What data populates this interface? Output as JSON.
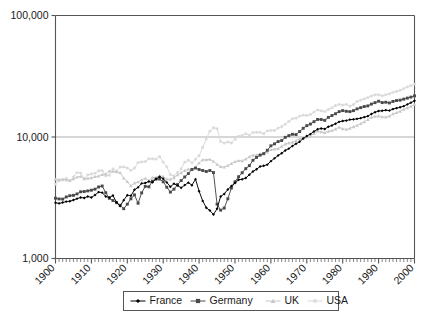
{
  "chart_data": {
    "type": "line",
    "title": "",
    "subtitle": "",
    "xlabel": "",
    "ylabel": "",
    "yscale": "log",
    "ylim": [
      1000,
      100000
    ],
    "xlim": [
      1900,
      2000
    ],
    "y_tick_labels": [
      "100,000",
      "10,000",
      "1,000"
    ],
    "y_tick_values": [
      100000,
      10000,
      1000
    ],
    "x_tick_labels": [
      "1900",
      "1910",
      "1920",
      "1930",
      "1940",
      "1950",
      "1960",
      "1970",
      "1980",
      "1990",
      "2000"
    ],
    "x_tick_values": [
      1900,
      1910,
      1920,
      1930,
      1940,
      1950,
      1960,
      1970,
      1980,
      1990,
      2000
    ],
    "x_minor_tick_step": 1,
    "grid": "horizontal-major-only",
    "legend_position": "bottom-center",
    "legend_entries": [
      "France",
      "Germany",
      "UK",
      "USA"
    ],
    "series": [
      {
        "name": "France",
        "color": "#000000",
        "marker": "diamond",
        "x": [
          1900,
          1901,
          1902,
          1903,
          1904,
          1905,
          1906,
          1907,
          1908,
          1909,
          1910,
          1911,
          1912,
          1913,
          1914,
          1915,
          1916,
          1917,
          1918,
          1919,
          1920,
          1921,
          1922,
          1923,
          1924,
          1925,
          1926,
          1927,
          1928,
          1929,
          1930,
          1931,
          1932,
          1933,
          1934,
          1935,
          1936,
          1937,
          1938,
          1939,
          1940,
          1941,
          1942,
          1943,
          1944,
          1945,
          1946,
          1947,
          1948,
          1949,
          1950,
          1951,
          1952,
          1953,
          1954,
          1955,
          1956,
          1957,
          1958,
          1959,
          1960,
          1961,
          1962,
          1963,
          1964,
          1965,
          1966,
          1967,
          1968,
          1969,
          1970,
          1971,
          1972,
          1973,
          1974,
          1975,
          1976,
          1977,
          1978,
          1979,
          1980,
          1981,
          1982,
          1983,
          1984,
          1985,
          1986,
          1987,
          1988,
          1989,
          1990,
          1991,
          1992,
          1993,
          1994,
          1995,
          1996,
          1997,
          1998,
          1999,
          2000
        ],
        "y": [
          2876,
          2842,
          2890,
          2940,
          2960,
          3030,
          3110,
          3180,
          3150,
          3240,
          3180,
          3330,
          3520,
          3485,
          3240,
          3180,
          3300,
          2900,
          2700,
          3020,
          3320,
          3280,
          3680,
          3850,
          4150,
          4180,
          4300,
          4230,
          4520,
          4710,
          4530,
          4230,
          3900,
          4130,
          3980,
          3820,
          4020,
          4210,
          4010,
          4500,
          3580,
          2980,
          2620,
          2480,
          2300,
          2570,
          3240,
          3400,
          3700,
          3950,
          4180,
          4450,
          4480,
          4600,
          4890,
          5200,
          5430,
          5720,
          5800,
          5920,
          6330,
          6670,
          7040,
          7340,
          7750,
          8030,
          8430,
          8790,
          9130,
          9720,
          10190,
          10560,
          11100,
          11570,
          11760,
          11630,
          12150,
          12440,
          12860,
          13320,
          13550,
          13650,
          13900,
          13970,
          14100,
          14290,
          14570,
          14840,
          15470,
          16000,
          16350,
          16450,
          16640,
          16500,
          16960,
          17280,
          17560,
          17950,
          18540,
          19180,
          19860
        ]
      },
      {
        "name": "Germany",
        "color": "#4a4a4a",
        "marker": "square",
        "x": [
          1900,
          1901,
          1902,
          1903,
          1904,
          1905,
          1906,
          1907,
          1908,
          1909,
          1910,
          1911,
          1912,
          1913,
          1914,
          1915,
          1916,
          1917,
          1918,
          1919,
          1920,
          1921,
          1922,
          1923,
          1924,
          1925,
          1926,
          1927,
          1928,
          1929,
          1930,
          1931,
          1932,
          1933,
          1934,
          1935,
          1936,
          1937,
          1938,
          1939,
          1940,
          1941,
          1942,
          1943,
          1944,
          1945,
          1946,
          1947,
          1948,
          1949,
          1950,
          1951,
          1952,
          1953,
          1954,
          1955,
          1956,
          1957,
          1958,
          1959,
          1960,
          1961,
          1962,
          1963,
          1964,
          1965,
          1966,
          1967,
          1968,
          1969,
          1970,
          1971,
          1972,
          1973,
          1974,
          1975,
          1976,
          1977,
          1978,
          1979,
          1980,
          1981,
          1982,
          1983,
          1984,
          1985,
          1986,
          1987,
          1988,
          1989,
          1990,
          1991,
          1992,
          1993,
          1994,
          1995,
          1996,
          1997,
          1998,
          1999,
          2000
        ],
        "y": [
          3134,
          3092,
          3082,
          3210,
          3290,
          3310,
          3400,
          3540,
          3560,
          3600,
          3650,
          3720,
          3880,
          3950,
          3480,
          3130,
          3000,
          2880,
          2740,
          2570,
          2800,
          3100,
          3340,
          2850,
          3470,
          3920,
          3890,
          4330,
          4500,
          4510,
          4280,
          3860,
          3520,
          3720,
          4060,
          4380,
          4690,
          5000,
          5400,
          5550,
          5400,
          5300,
          5200,
          5300,
          5100,
          2800,
          2500,
          2600,
          3100,
          3800,
          4280,
          4710,
          5080,
          5490,
          5810,
          6430,
          6790,
          7090,
          7300,
          7780,
          8460,
          8780,
          9170,
          9350,
          9940,
          10270,
          10530,
          10470,
          11090,
          11790,
          12400,
          12780,
          13370,
          13950,
          13940,
          13710,
          14500,
          15020,
          15540,
          16170,
          16490,
          16270,
          16180,
          16480,
          17050,
          17440,
          17810,
          18030,
          18660,
          19170,
          19700,
          19200,
          19330,
          19060,
          19620,
          19960,
          20100,
          20500,
          20900,
          21300,
          21800
        ]
      },
      {
        "name": "UK",
        "color": "#c8c8c8",
        "marker": "triangle",
        "x": [
          1900,
          1901,
          1902,
          1903,
          1904,
          1905,
          1906,
          1907,
          1908,
          1909,
          1910,
          1911,
          1912,
          1913,
          1914,
          1915,
          1916,
          1917,
          1918,
          1919,
          1920,
          1921,
          1922,
          1923,
          1924,
          1925,
          1926,
          1927,
          1928,
          1929,
          1930,
          1931,
          1932,
          1933,
          1934,
          1935,
          1936,
          1937,
          1938,
          1939,
          1940,
          1941,
          1942,
          1943,
          1944,
          1945,
          1946,
          1947,
          1948,
          1949,
          1950,
          1951,
          1952,
          1953,
          1954,
          1955,
          1956,
          1957,
          1958,
          1959,
          1960,
          1961,
          1962,
          1963,
          1964,
          1965,
          1966,
          1967,
          1968,
          1969,
          1970,
          1971,
          1972,
          1973,
          1974,
          1975,
          1976,
          1977,
          1978,
          1979,
          1980,
          1981,
          1982,
          1983,
          1984,
          1985,
          1986,
          1987,
          1988,
          1989,
          1990,
          1991,
          1992,
          1993,
          1994,
          1995,
          1996,
          1997,
          1998,
          1999,
          2000
        ],
        "y": [
          4492,
          4400,
          4500,
          4450,
          4400,
          4530,
          4680,
          4750,
          4520,
          4570,
          4610,
          4730,
          4760,
          4920,
          4960,
          5250,
          5220,
          5180,
          5100,
          4600,
          4300,
          3970,
          4180,
          4270,
          4440,
          4580,
          4370,
          4650,
          4660,
          4790,
          4730,
          4500,
          4490,
          4620,
          4880,
          5080,
          5300,
          5430,
          5440,
          5670,
          6130,
          6500,
          6500,
          6550,
          6300,
          5950,
          5700,
          5650,
          5830,
          6050,
          6270,
          6400,
          6380,
          6600,
          6880,
          7080,
          7130,
          7250,
          7260,
          7530,
          7870,
          7960,
          8030,
          8370,
          8770,
          8930,
          9060,
          9330,
          9670,
          9750,
          10000,
          10250,
          10700,
          11220,
          11030,
          10870,
          11150,
          11290,
          11650,
          12040,
          11700,
          11550,
          11790,
          12140,
          12480,
          12900,
          13350,
          13930,
          14550,
          14800,
          14900,
          14640,
          14600,
          14900,
          15500,
          15900,
          16300,
          16900,
          17400,
          17900,
          18500
        ]
      },
      {
        "name": "USA",
        "color": "#d8d8d8",
        "marker": "asterisk",
        "x": [
          1900,
          1901,
          1902,
          1903,
          1904,
          1905,
          1906,
          1907,
          1908,
          1909,
          1910,
          1911,
          1912,
          1913,
          1914,
          1915,
          1916,
          1917,
          1918,
          1919,
          1920,
          1921,
          1922,
          1923,
          1924,
          1925,
          1926,
          1927,
          1928,
          1929,
          1930,
          1931,
          1932,
          1933,
          1934,
          1935,
          1936,
          1937,
          1938,
          1939,
          1940,
          1941,
          1942,
          1943,
          1944,
          1945,
          1946,
          1947,
          1948,
          1949,
          1950,
          1951,
          1952,
          1953,
          1954,
          1955,
          1956,
          1957,
          1958,
          1959,
          1960,
          1961,
          1962,
          1963,
          1964,
          1965,
          1966,
          1967,
          1968,
          1969,
          1970,
          1971,
          1972,
          1973,
          1974,
          1975,
          1976,
          1977,
          1978,
          1979,
          1980,
          1981,
          1982,
          1983,
          1984,
          1985,
          1986,
          1987,
          1988,
          1989,
          1990,
          1991,
          1992,
          1993,
          1994,
          1995,
          1996,
          1997,
          1998,
          1999,
          2000
        ],
        "y": [
          4091,
          4464,
          4421,
          4551,
          4350,
          4700,
          5100,
          5050,
          4550,
          4880,
          4960,
          5030,
          5270,
          5300,
          4790,
          4840,
          5470,
          5250,
          5660,
          5680,
          5550,
          5320,
          5540,
          6160,
          6230,
          6280,
          6630,
          6600,
          6570,
          6900,
          6210,
          5690,
          4900,
          4780,
          5110,
          5470,
          6200,
          6430,
          6130,
          6560,
          7010,
          8210,
          9640,
          11150,
          11930,
          11720,
          9200,
          8890,
          9100,
          8940,
          9560,
          10130,
          10320,
          10630,
          10340,
          10900,
          10920,
          10910,
          10630,
          11230,
          11330,
          11330,
          11830,
          12160,
          12710,
          13420,
          14130,
          14300,
          14860,
          15120,
          15030,
          15310,
          16010,
          16690,
          16450,
          16180,
          16830,
          17400,
          18150,
          18550,
          18280,
          18550,
          17950,
          18500,
          19600,
          20100,
          20600,
          21100,
          21750,
          22270,
          22260,
          21840,
          22250,
          22640,
          23300,
          23700,
          24200,
          25000,
          25800,
          26500,
          27200
        ]
      }
    ]
  },
  "axes": {
    "y_labels": [
      {
        "text": "100,000",
        "value": 100000
      },
      {
        "text": "10,000",
        "value": 10000
      },
      {
        "text": "1,000",
        "value": 1000
      }
    ],
    "x_labels": [
      "1900",
      "1910",
      "1920",
      "1930",
      "1940",
      "1950",
      "1960",
      "1970",
      "1980",
      "1990",
      "2000"
    ]
  },
  "legend": {
    "items": [
      {
        "label": "France",
        "color": "#000000",
        "marker": "diamond"
      },
      {
        "label": "Germany",
        "color": "#4a4a4a",
        "marker": "square"
      },
      {
        "label": "UK",
        "color": "#c8c8c8",
        "marker": "triangle"
      },
      {
        "label": "USA",
        "color": "#d8d8d8",
        "marker": "asterisk"
      }
    ]
  },
  "colors": {
    "axis": "#555555",
    "grid": "#999999",
    "plot_background": "#ffffff",
    "page_background": "#ffffff"
  }
}
